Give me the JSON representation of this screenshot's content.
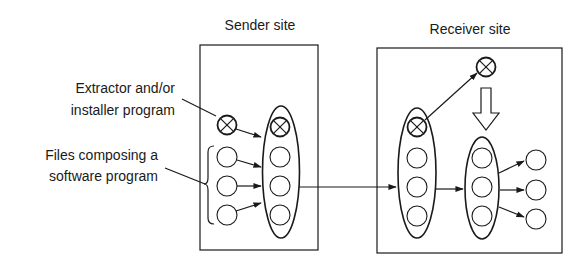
{
  "diagram": {
    "sender": {
      "title": "Sender site"
    },
    "receiver": {
      "title": "Receiver site"
    },
    "annotations": {
      "extractor_line1": "Extractor and/or",
      "extractor_line2": "installer program",
      "files_line1": "Files composing a",
      "files_line2": "software program"
    },
    "colors": {
      "stroke": "#1a1a1a",
      "background": "#ffffff"
    }
  }
}
